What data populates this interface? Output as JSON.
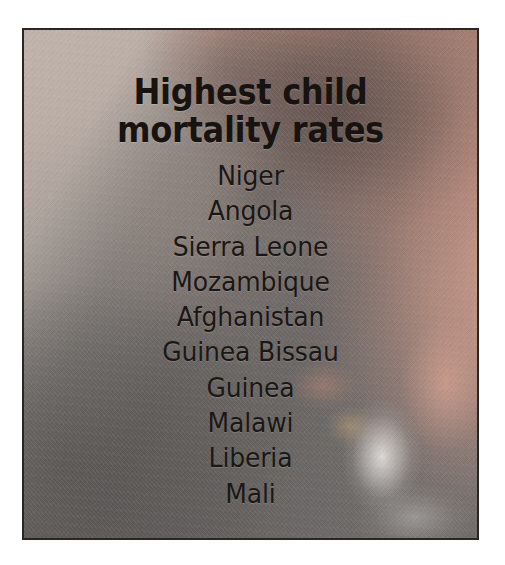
{
  "poster": {
    "title_lines": [
      "Highest child",
      "mortality rates"
    ],
    "countries": [
      "Niger",
      "Angola",
      "Sierra Leone",
      "Mozambique",
      "Afghanistan",
      "Guinea Bissau",
      "Guinea",
      "Malawi",
      "Liberia",
      "Mali"
    ],
    "colors": {
      "page_background": "#ffffff",
      "frame_border": "#2b2622",
      "title_text": "#171310",
      "list_text": "#1b1714",
      "photo_beige": "#c2b6ae",
      "photo_gray": "#7e7b78",
      "photo_scarf_pink": "#efab96",
      "photo_shadow": "#484544",
      "photo_highlight": "#f8f6f3"
    }
  }
}
